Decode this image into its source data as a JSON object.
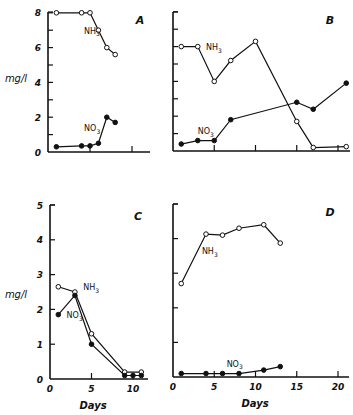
{
  "chart_data": [
    {
      "panel": "A",
      "type": "line",
      "ylabel": "mg/l",
      "xlabel": "",
      "ylim": [
        0,
        8
      ],
      "yticks": [
        0,
        2,
        4,
        6,
        8
      ],
      "xlim": [
        0,
        14
      ],
      "xticks": [
        5,
        10
      ],
      "xticklabels": [],
      "series": [
        {
          "name": "NH3",
          "marker": "open",
          "x": [
            1,
            4,
            5,
            6,
            7,
            8
          ],
          "y": [
            8.0,
            8.0,
            8.0,
            7.0,
            6.0,
            5.6
          ]
        },
        {
          "name": "NO3",
          "marker": "filled",
          "x": [
            1,
            4,
            5,
            6,
            7,
            8
          ],
          "y": [
            0.3,
            0.35,
            0.35,
            0.5,
            2.0,
            1.7
          ]
        }
      ],
      "series_labels": [
        {
          "text": "NH3",
          "x": 4.3,
          "y": 6.8
        },
        {
          "text": "NO3",
          "x": 4.3,
          "y": 1.2
        }
      ]
    },
    {
      "panel": "B",
      "type": "line",
      "ylabel": "",
      "xlabel": "",
      "ylim": [
        0,
        8
      ],
      "yticks": [
        1,
        2,
        3,
        4,
        5,
        6,
        7,
        8
      ],
      "xlim": [
        0,
        22
      ],
      "xticks": [
        5,
        10,
        15,
        20
      ],
      "xticklabels": [],
      "series": [
        {
          "name": "NH3",
          "marker": "open",
          "x": [
            1,
            3,
            5,
            7,
            10,
            15,
            17,
            21
          ],
          "y": [
            6.0,
            6.0,
            4.0,
            5.2,
            6.3,
            1.7,
            0.2,
            0.25
          ]
        },
        {
          "name": "NO3",
          "marker": "filled",
          "x": [
            1,
            3,
            5,
            7,
            15,
            17,
            21
          ],
          "y": [
            0.4,
            0.6,
            0.6,
            1.8,
            2.8,
            2.4,
            3.9
          ]
        }
      ],
      "series_labels": [
        {
          "text": "NH3",
          "x": 4.0,
          "y": 5.8
        },
        {
          "text": "NO3",
          "x": 3.0,
          "y": 0.95
        }
      ]
    },
    {
      "panel": "C",
      "type": "line",
      "ylabel": "mg/l",
      "xlabel": "Days",
      "ylim": [
        0,
        5
      ],
      "yticks": [
        0,
        1,
        2,
        3,
        4,
        5
      ],
      "xlim": [
        0,
        12
      ],
      "xticks": [
        0,
        5,
        10
      ],
      "xticklabels": [
        "0",
        "5",
        "10"
      ],
      "series": [
        {
          "name": "NH3",
          "marker": "open",
          "x": [
            1,
            3,
            5,
            9,
            11
          ],
          "y": [
            2.65,
            2.5,
            1.3,
            0.2,
            0.2
          ]
        },
        {
          "name": "NO3",
          "marker": "filled",
          "x": [
            1,
            3,
            5,
            9,
            10,
            11
          ],
          "y": [
            1.85,
            2.4,
            1.0,
            0.1,
            0.1,
            0.1
          ]
        }
      ],
      "series_labels": [
        {
          "text": "NH3",
          "x": 4.0,
          "y": 2.55
        },
        {
          "text": "NO3",
          "x": 2.0,
          "y": 1.75
        }
      ]
    },
    {
      "panel": "D",
      "type": "line",
      "ylabel": "",
      "xlabel": "Days",
      "ylim": [
        0,
        5
      ],
      "yticks": [
        1,
        2,
        3,
        4,
        5
      ],
      "xlim": [
        0,
        21
      ],
      "xticks": [
        0,
        5,
        10,
        15,
        20
      ],
      "xticklabels": [
        "0",
        "5",
        "10",
        "15",
        "20"
      ],
      "series": [
        {
          "name": "NH3",
          "marker": "open",
          "x": [
            1,
            4,
            6,
            8,
            11,
            13
          ],
          "y": [
            2.7,
            4.13,
            4.1,
            4.3,
            4.4,
            3.87
          ]
        },
        {
          "name": "NO3",
          "marker": "filled",
          "x": [
            1,
            4,
            6,
            8,
            11,
            13
          ],
          "y": [
            0.1,
            0.1,
            0.1,
            0.1,
            0.2,
            0.3
          ]
        }
      ],
      "series_labels": [
        {
          "text": "NH3",
          "x": 3.5,
          "y": 3.55
        },
        {
          "text": "NO3",
          "x": 6.5,
          "y": 0.3
        }
      ]
    }
  ]
}
